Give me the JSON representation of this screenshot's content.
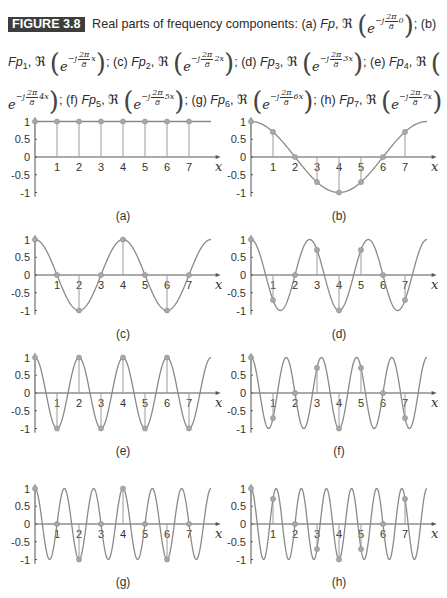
{
  "figure": {
    "badge": "FIGURE 3.8",
    "intro": "Real parts of frequency components:",
    "items": [
      {
        "tag": "(a)",
        "name": "Fp",
        "sub": "",
        "exponent": "0"
      },
      {
        "tag": "(b)",
        "name": "Fp",
        "sub": "1",
        "exponent": "x"
      },
      {
        "tag": "(c)",
        "name": "Fp",
        "sub": "2",
        "exponent": "2x"
      },
      {
        "tag": "(d)",
        "name": "Fp",
        "sub": "3",
        "exponent": "3x"
      },
      {
        "tag": "(e)",
        "name": "Fp",
        "sub": "4",
        "exponent": "4x"
      },
      {
        "tag": "(f)",
        "name": "Fp",
        "sub": "5",
        "exponent": "5x"
      },
      {
        "tag": "(g)",
        "name": "Fp",
        "sub": "6",
        "exponent": "6x"
      },
      {
        "tag": "(h)",
        "name": "Fp",
        "sub": "7",
        "exponent": "7x"
      }
    ],
    "re_symbol": "ℜ",
    "e_symbol": "e",
    "minus_j": "−j",
    "frac_num": "2π",
    "frac_den": "8"
  },
  "colors": {
    "curve": "#8a8a8a",
    "axis": "#555555",
    "stem": "#9a9a9a",
    "marker": "#a8a8a8",
    "badge_bg": "#3d3d3d"
  },
  "chart_data": [
    {
      "type": "line",
      "label": "(a)",
      "title": "Fp, Re(e^{-j(2π/8)·0})",
      "frequency": 0,
      "x_range": [
        0,
        8
      ],
      "ylim": [
        -1,
        1
      ],
      "yticks": [
        "1",
        "0.5",
        "0",
        "-0.5",
        "-1"
      ],
      "xticks": [
        "1",
        "2",
        "3",
        "4",
        "5",
        "6",
        "7"
      ],
      "xlabel": "x",
      "samples_x": [
        0,
        1,
        2,
        3,
        4,
        5,
        6,
        7
      ],
      "samples_y": [
        1,
        1,
        1,
        1,
        1,
        1,
        1,
        1
      ]
    },
    {
      "type": "line",
      "label": "(b)",
      "title": "Fp1, Re(e^{-j(2π/8)x})",
      "frequency": 1,
      "x_range": [
        0,
        8
      ],
      "ylim": [
        -1,
        1
      ],
      "yticks": [
        "1",
        "0.5",
        "0",
        "-0.5",
        "-1"
      ],
      "xticks": [
        "1",
        "2",
        "3",
        "4",
        "5",
        "6",
        "7"
      ],
      "xlabel": "x",
      "samples_x": [
        0,
        1,
        2,
        3,
        4,
        5,
        6,
        7
      ],
      "samples_y": [
        1,
        0.707,
        0,
        -0.707,
        -1,
        -0.707,
        0,
        0.707
      ]
    },
    {
      "type": "line",
      "label": "(c)",
      "title": "Fp2, Re(e^{-j(2π/8)2x})",
      "frequency": 2,
      "x_range": [
        0,
        8
      ],
      "ylim": [
        -1,
        1
      ],
      "yticks": [
        "1",
        "0.5",
        "0",
        "-0.5",
        "-1"
      ],
      "xticks": [
        "1",
        "2",
        "3",
        "4",
        "5",
        "6",
        "7"
      ],
      "xlabel": "x",
      "samples_x": [
        0,
        1,
        2,
        3,
        4,
        5,
        6,
        7
      ],
      "samples_y": [
        1,
        0,
        -1,
        0,
        1,
        0,
        -1,
        0
      ]
    },
    {
      "type": "line",
      "label": "(d)",
      "title": "Fp3, Re(e^{-j(2π/8)3x})",
      "frequency": 3,
      "x_range": [
        0,
        8
      ],
      "ylim": [
        -1,
        1
      ],
      "yticks": [
        "1",
        "0.5",
        "0",
        "-0.5",
        "-1"
      ],
      "xticks": [
        "1",
        "2",
        "3",
        "4",
        "5",
        "6",
        "7"
      ],
      "xlabel": "x",
      "samples_x": [
        0,
        1,
        2,
        3,
        4,
        5,
        6,
        7
      ],
      "samples_y": [
        1,
        -0.707,
        0,
        0.707,
        -1,
        0.707,
        0,
        -0.707
      ]
    },
    {
      "type": "line",
      "label": "(e)",
      "title": "Fp4, Re(e^{-j(2π/8)4x})",
      "frequency": 4,
      "x_range": [
        0,
        8
      ],
      "ylim": [
        -1,
        1
      ],
      "yticks": [
        "1",
        "0.5",
        "0",
        "-0.5",
        "-1"
      ],
      "xticks": [
        "1",
        "2",
        "3",
        "4",
        "5",
        "6",
        "7"
      ],
      "xlabel": "x",
      "samples_x": [
        0,
        1,
        2,
        3,
        4,
        5,
        6,
        7
      ],
      "samples_y": [
        1,
        -1,
        1,
        -1,
        1,
        -1,
        1,
        -1
      ]
    },
    {
      "type": "line",
      "label": "(f)",
      "title": "Fp5, Re(e^{-j(2π/8)5x})",
      "frequency": 5,
      "x_range": [
        0,
        8
      ],
      "ylim": [
        -1,
        1
      ],
      "yticks": [
        "1",
        "0.5",
        "0",
        "-0.5",
        "-1"
      ],
      "xticks": [
        "1",
        "2",
        "3",
        "4",
        "5",
        "6",
        "7"
      ],
      "xlabel": "x",
      "samples_x": [
        0,
        1,
        2,
        3,
        4,
        5,
        6,
        7
      ],
      "samples_y": [
        1,
        -0.707,
        0,
        0.707,
        -1,
        0.707,
        0,
        -0.707
      ]
    },
    {
      "type": "line",
      "label": "(g)",
      "title": "Fp6, Re(e^{-j(2π/8)6x})",
      "frequency": 6,
      "x_range": [
        0,
        8
      ],
      "ylim": [
        -1,
        1
      ],
      "yticks": [
        "1",
        "0.5",
        "0",
        "-0.5",
        "-1"
      ],
      "xticks": [
        "1",
        "2",
        "3",
        "4",
        "5",
        "6",
        "7"
      ],
      "xlabel": "x",
      "samples_x": [
        0,
        1,
        2,
        3,
        4,
        5,
        6,
        7
      ],
      "samples_y": [
        1,
        0,
        -1,
        0,
        1,
        0,
        -1,
        0
      ]
    },
    {
      "type": "line",
      "label": "(h)",
      "title": "Fp7, Re(e^{-j(2π/8)7x})",
      "frequency": 7,
      "x_range": [
        0,
        8
      ],
      "ylim": [
        -1,
        1
      ],
      "yticks": [
        "1",
        "0.5",
        "0",
        "-0.5",
        "-1"
      ],
      "xticks": [
        "1",
        "2",
        "3",
        "4",
        "5",
        "6",
        "7"
      ],
      "xlabel": "x",
      "samples_x": [
        0,
        1,
        2,
        3,
        4,
        5,
        6,
        7
      ],
      "samples_y": [
        1,
        0.707,
        0,
        -0.707,
        -1,
        -0.707,
        0,
        0.707
      ]
    }
  ],
  "layout": {
    "panels": [
      {
        "ox": 35,
        "oy": 157,
        "label_y": 209
      },
      {
        "ox": 251,
        "oy": 157,
        "label_y": 209
      },
      {
        "ox": 35,
        "oy": 275,
        "label_y": 327
      },
      {
        "ox": 251,
        "oy": 275,
        "label_y": 327
      },
      {
        "ox": 35,
        "oy": 393,
        "label_y": 444
      },
      {
        "ox": 251,
        "oy": 393,
        "label_y": 444
      },
      {
        "ox": 35,
        "oy": 524,
        "label_y": 575
      },
      {
        "ox": 251,
        "oy": 524,
        "label_y": 575
      }
    ],
    "px_per_x": 22,
    "px_per_y": 35.5
  }
}
